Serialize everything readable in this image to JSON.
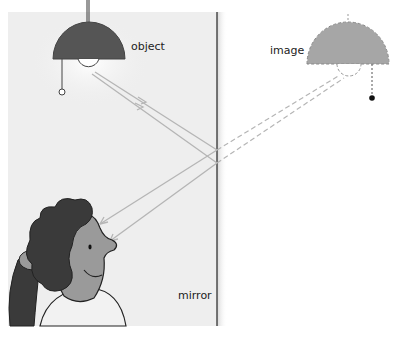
{
  "diagram": {
    "labels": {
      "object": "object",
      "image": "image",
      "mirror": "mirror"
    },
    "colors": {
      "panel_bg": "#eeeeee",
      "mirror_line": "#333333",
      "object_lamp": "#555555",
      "image_lamp": "#a6a6a6",
      "ray": "#b5b5b5",
      "hair": "#3a3a3a",
      "skin": "#9a9a9a"
    },
    "elements": [
      {
        "id": "object-lamp",
        "kind": "lamp",
        "style": "solid"
      },
      {
        "id": "image-lamp",
        "kind": "lamp",
        "style": "dashed"
      },
      {
        "id": "mirror",
        "kind": "plane-mirror"
      },
      {
        "id": "observer",
        "kind": "person"
      },
      {
        "id": "incident-rays",
        "count": 2,
        "style": "solid-with-arrows"
      },
      {
        "id": "reflected-rays",
        "count": 2,
        "style": "solid-with-arrows"
      },
      {
        "id": "virtual-rays",
        "count": 2,
        "style": "dashed"
      }
    ]
  }
}
